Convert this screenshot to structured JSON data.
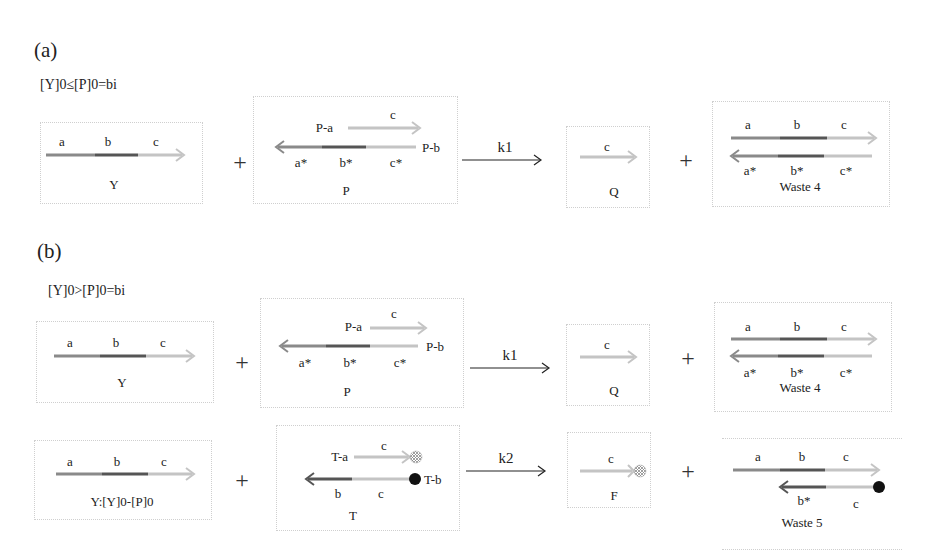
{
  "panels": {
    "a": {
      "label": "(a)",
      "condition": "[Y]0≤[P]0=bi",
      "reactions": [
        {
          "reactant1": {
            "name": "Y",
            "domains": [
              "a",
              "b",
              "c"
            ]
          },
          "reactant2": {
            "name": "P",
            "top_strand": "P-a",
            "top_domain": "c",
            "bottom_strand": "P-b",
            "bottom_domains": [
              "a*",
              "b*",
              "c*"
            ]
          },
          "rate": "k1",
          "product1": {
            "name": "Q",
            "domains": [
              "c"
            ]
          },
          "product2": {
            "name": "Waste 4",
            "top_domains": [
              "a",
              "b",
              "c"
            ],
            "bottom_domains": [
              "a*",
              "b*",
              "c*"
            ]
          }
        }
      ]
    },
    "b": {
      "label": "(b)",
      "condition": "[Y]0>[P]0=bi",
      "reactions": [
        {
          "reactant1": {
            "name": "Y",
            "domains": [
              "a",
              "b",
              "c"
            ]
          },
          "reactant2": {
            "name": "P",
            "top_strand": "P-a",
            "top_domain": "c",
            "bottom_strand": "P-b",
            "bottom_domains": [
              "a*",
              "b*",
              "c*"
            ]
          },
          "rate": "k1",
          "product1": {
            "name": "Q",
            "domains": [
              "c"
            ]
          },
          "product2": {
            "name": "Waste 4",
            "top_domains": [
              "a",
              "b",
              "c"
            ],
            "bottom_domains": [
              "a*",
              "b*",
              "c*"
            ]
          }
        },
        {
          "reactant1": {
            "name": "Y:[Y]0-[P]0",
            "domains": [
              "a",
              "b",
              "c"
            ]
          },
          "reactant2": {
            "name": "T",
            "top_strand": "T-a",
            "top_domain": "c",
            "bottom_strand": "T-b",
            "bottom_domains": [
              "b",
              "c"
            ]
          },
          "rate": "k2",
          "product1": {
            "name": "F",
            "domains": [
              "c"
            ]
          },
          "product2": {
            "name": "Waste 5",
            "top_domains": [
              "a",
              "b",
              "c"
            ],
            "bottom_domains": [
              "b*",
              "c"
            ]
          }
        }
      ]
    }
  },
  "symbols": {
    "plus": "+"
  },
  "colors": {
    "domain_a": "#8a8a8a",
    "domain_b": "#555555",
    "domain_c": "#c4c4c4",
    "quencher": "#111111",
    "fluorophore": "#b0b0b0",
    "box_border": "#cfcfcf"
  }
}
